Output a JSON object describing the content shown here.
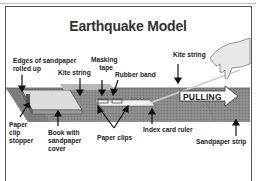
{
  "title": "Earthquake Model",
  "labels": {
    "edges": [
      "Edges of sandpaper",
      "rolled up"
    ],
    "kite_string_left": "Kite string",
    "masking_tape": [
      "Masking",
      "tape"
    ],
    "rubber_band": "Rubber band",
    "kite_string_right": "Kite string",
    "paper_clip_stopper": [
      "Paper",
      "clip",
      "stopper"
    ],
    "book": [
      "Book with",
      "sandpaper",
      "cover"
    ],
    "paper_clips": "Paper clips",
    "index_card_ruler": "Index card ruler",
    "sandpaper_strip": "Sandpaper strip",
    "pulling": "PULLING"
  },
  "colors": {
    "sandpaper": "#8c8c8c",
    "sandpaper_dark": "#6e6e6e",
    "book_cover": "#d9d9d9",
    "arrow_fill": "#ffffff",
    "text": "#222222"
  }
}
